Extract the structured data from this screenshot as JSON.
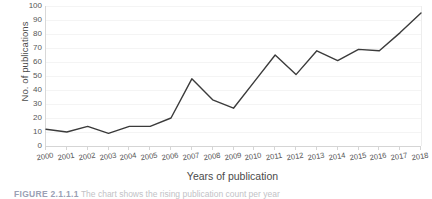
{
  "figure": {
    "caption_label": "FIGURE 2.1.1.1",
    "caption_text": "The chart shows the rising publication count per year"
  },
  "chart_data": {
    "type": "line",
    "title": "",
    "xlabel": "Years of publication",
    "ylabel": "No. of publications",
    "categories": [
      "2000",
      "2001",
      "2002",
      "2003",
      "2004",
      "2005",
      "2006",
      "2007",
      "2008",
      "2009",
      "2010",
      "2011",
      "2012",
      "2013",
      "2014",
      "2015",
      "2016",
      "2017",
      "2018"
    ],
    "values": [
      12,
      10,
      14,
      9,
      14,
      14,
      20,
      48,
      33,
      27,
      46,
      65,
      51,
      68,
      61,
      69,
      68,
      81,
      95
    ],
    "ylim": [
      0,
      100
    ],
    "ytick_labels": [
      "100",
      "90",
      "80",
      "70",
      "60",
      "50",
      "40",
      "30",
      "20",
      "10",
      "0"
    ],
    "ytick_values": [
      100,
      90,
      80,
      70,
      60,
      50,
      40,
      30,
      20,
      10,
      0
    ],
    "ystep": 10,
    "grid": true,
    "legend": false,
    "line_color": "#3b3b3b",
    "grid_color": "#f4f4f4",
    "axis_color": "#d5d5d5",
    "background": "#ffffff"
  }
}
